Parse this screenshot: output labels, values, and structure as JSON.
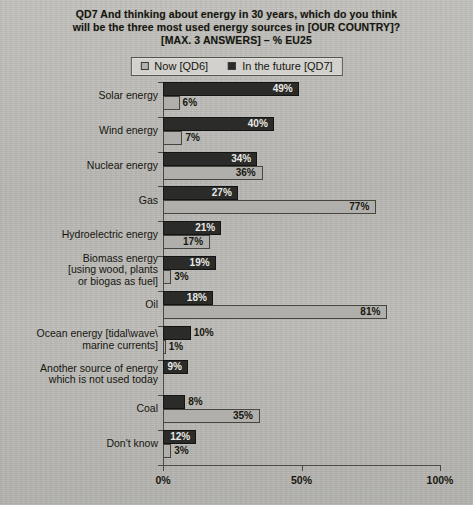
{
  "title": {
    "line1": "QD7 And thinking about energy in 30 years, which do you think",
    "line2": "will be the three most used energy sources in [OUR COUNTRY]?",
    "line3": "[MAX. 3 ANSWERS] – % EU25"
  },
  "legend": {
    "now_label": "Now [QD6]",
    "future_label": "In the future [QD7]",
    "now_color": "#b0afab",
    "future_color": "#2b2b29",
    "position": "top-center"
  },
  "axis": {
    "ticks": [
      "0%",
      "50%",
      "100%"
    ],
    "tick_values": [
      0,
      50,
      100
    ]
  },
  "chart_data": {
    "type": "bar",
    "orientation": "horizontal",
    "title": "QD7 And thinking about energy in 30 years, which do you think will be the three most used energy sources in [OUR COUNTRY]? [MAX. 3 ANSWERS] – % EU25",
    "xlabel": "",
    "ylabel": "",
    "xlim": [
      0,
      100
    ],
    "grid": false,
    "legend_position": "top-center",
    "categories": [
      "Solar energy",
      "Wind energy",
      "Nuclear energy",
      "Gas",
      "Hydroelectric energy",
      "Biomass energy\n[using wood, plants\nor biogas as fuel]",
      "Oil",
      "Ocean energy [tidal\\wave\\\nmarine currents]",
      "Another source of energy\nwhich is not used today",
      "Coal",
      "Don't know"
    ],
    "series": [
      {
        "name": "In the future [QD7]",
        "color": "#2b2b29",
        "values": [
          49,
          40,
          34,
          27,
          21,
          19,
          18,
          10,
          9,
          8,
          12
        ],
        "labels": [
          "49%",
          "40%",
          "34%",
          "27%",
          "21%",
          "19%",
          "18%",
          "10%",
          "9%",
          "8%",
          "12%"
        ]
      },
      {
        "name": "Now [QD6]",
        "color": "#b0afab",
        "values": [
          6,
          7,
          36,
          77,
          17,
          3,
          81,
          1,
          null,
          35,
          3
        ],
        "labels": [
          "6%",
          "7%",
          "36%",
          "77%",
          "17%",
          "3%",
          "81%",
          "1%",
          "",
          "35%",
          "3%"
        ]
      }
    ]
  }
}
